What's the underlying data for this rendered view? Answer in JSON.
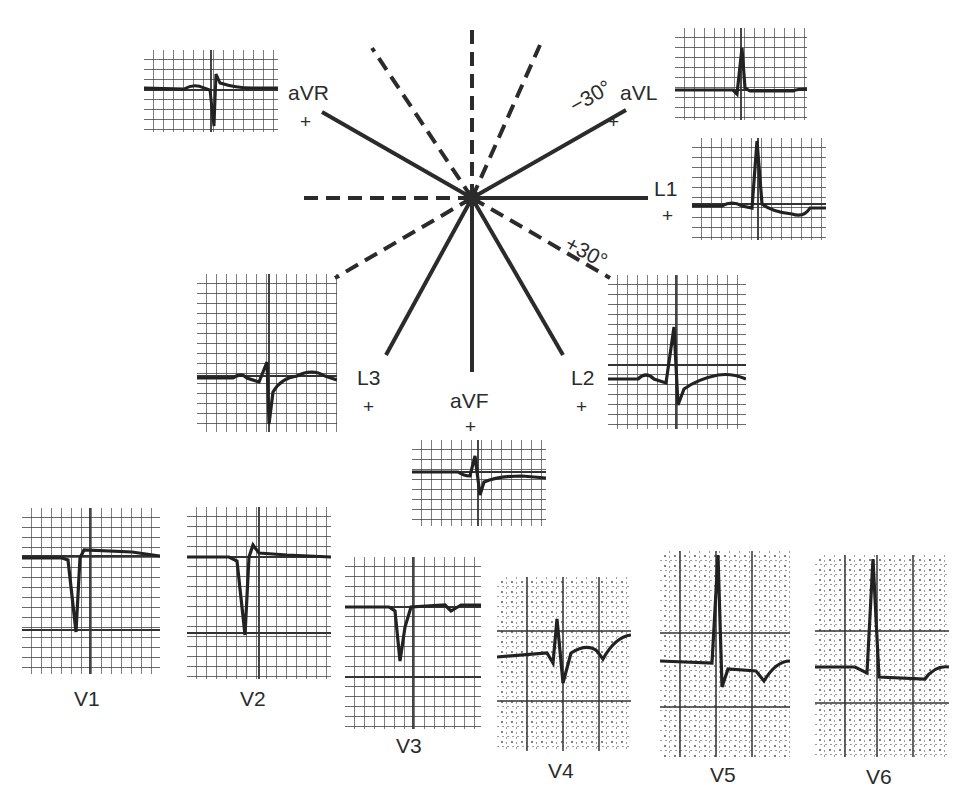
{
  "figure": {
    "title": "",
    "axis_labels": {
      "aVR": {
        "name": "aVR",
        "sign": "+"
      },
      "aVL": {
        "name": "aVL",
        "sign": "+",
        "angle": "−30°"
      },
      "L1": {
        "name": "L1",
        "sign": "+"
      },
      "L2": {
        "name": "L2",
        "sign": "+"
      },
      "L3": {
        "name": "L3",
        "sign": "+"
      },
      "aVF": {
        "name": "aVF",
        "sign": "+"
      },
      "plus30": {
        "angle": "+30°"
      }
    },
    "precordial_labels": [
      "V1",
      "V2",
      "V3",
      "V4",
      "V5",
      "V6"
    ],
    "colors": {
      "ink": "#2b2b2b",
      "grid": "#3a3a3a",
      "paper": "#ffffff"
    }
  }
}
